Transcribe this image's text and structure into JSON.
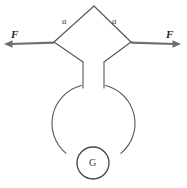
{
  "figure": {
    "background_color": "#ffffff",
    "line_color": "#555555",
    "arrow_color": "#6e6e6e",
    "text_color": "#2b2b2b",
    "labels": {
      "side_left": "a",
      "side_right": "a",
      "force_left": "F",
      "force_right": "F",
      "gauge": "G"
    },
    "geometry": {
      "diamond": {
        "apex_top": [
          94,
          6
        ],
        "corner_left": [
          54,
          42
        ],
        "corner_right": [
          131,
          42
        ],
        "lower_left_bend": [
          83,
          62
        ],
        "lower_right_bend": [
          104,
          62
        ]
      },
      "stems": {
        "left_x": 83,
        "right_x": 104,
        "top_y": 62,
        "bottom_y": 88
      },
      "big_circle": {
        "center": [
          93,
          122
        ],
        "radius": 39,
        "top_gap_deg": 30,
        "bottom_gap_deg": 44
      },
      "gauge_circle": {
        "center": [
          93,
          163
        ],
        "radius": 16
      },
      "arrows": {
        "left": {
          "from": [
            54,
            42
          ],
          "to": [
            5,
            44
          ]
        },
        "right": {
          "from": [
            131,
            42
          ],
          "to": [
            180,
            44
          ]
        }
      }
    },
    "label_positions": {
      "side_left": [
        62,
        18
      ],
      "side_right": [
        112,
        18
      ],
      "force_left": [
        11,
        30
      ],
      "force_right": [
        166,
        30
      ],
      "gauge": [
        89,
        158
      ]
    }
  }
}
